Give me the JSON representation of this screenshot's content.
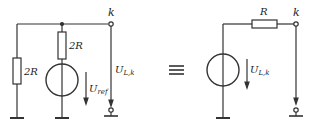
{
  "diagram": {
    "type": "circuit-equivalence",
    "colors": {
      "stroke": "#333333",
      "background": "#ffffff"
    },
    "left_circuit": {
      "terminal_label": "k",
      "resistor_left": {
        "label": "2R"
      },
      "resistor_middle": {
        "label": "2R"
      },
      "source": {
        "label_main": "U",
        "label_sub": "ref"
      },
      "output_voltage": {
        "label_main": "U",
        "label_sub": "L,k"
      }
    },
    "equivalence_symbol": "≡",
    "right_circuit": {
      "terminal_label": "k",
      "resistor": {
        "label": "R"
      },
      "source": {
        "label_main": "U",
        "label_sub": "L,k"
      },
      "output_voltage": {
        "label_main": "",
        "label_sub": ""
      }
    }
  }
}
